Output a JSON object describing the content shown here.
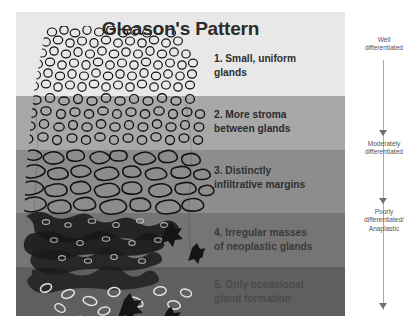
{
  "figure": {
    "title": "Gleason's Pattern"
  },
  "patterns": [
    {
      "id": 1,
      "label": "1. Small, uniform\ngland s",
      "text": "1. Small, uniform\nglands",
      "band_color": "#e8e8e8",
      "text_color": "#2e2e2e"
    },
    {
      "id": 2,
      "label": "2. More stroma\nbetween glands",
      "text": "2. More stroma\nbetween glands",
      "band_color": "#a8a8a8",
      "text_color": "#2b2b2b"
    },
    {
      "id": 3,
      "label": "3. Distinctly\ninfiltrative margins",
      "text": "3. Distinctly\ninfiltrative margins",
      "band_color": "#8d8d8d",
      "text_color": "#303030"
    },
    {
      "id": 4,
      "label": "4. Irregular masses\nof neoplastic glands",
      "text": "4. Irregular masses\nof neoplastic glands",
      "band_color": "#757575",
      "text_color": "#3a3a3a"
    },
    {
      "id": 5,
      "label": "5. Only occasional\ngland formation",
      "text": "5. Only occasional\ngland formation",
      "band_color": "#5f5f5f",
      "text_color": "#4a4a4a"
    }
  ],
  "scale": {
    "items": [
      {
        "text": "Well\ndifferentiated"
      },
      {
        "text": "Moderately\ndifferentiated"
      },
      {
        "text": "Poorly\ndifferentiated/\nAnaplastic"
      }
    ],
    "line_color": "#a9a9a9",
    "arrow_color": "#6f6f6f"
  },
  "illustration": {
    "name": "prostate-gland-histology-drawing",
    "description": "Hand-drawn grayscale histology showing glandular architecture degrading from small uniform glands at top to sparse irregular masses at bottom",
    "ink_color": "#1a1a1a"
  }
}
